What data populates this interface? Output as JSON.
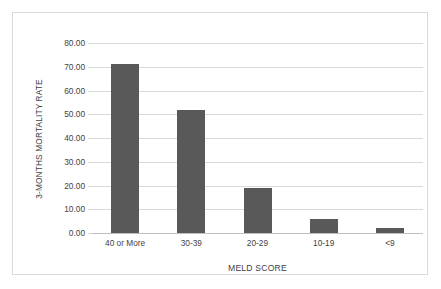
{
  "chart_data": {
    "type": "bar",
    "title": "",
    "xlabel": "MELD SCORE",
    "ylabel": "3-MONTHS MORTALITY RATE",
    "categories": [
      "40 or More",
      "30-39",
      "20-29",
      "10-19",
      "<9"
    ],
    "values": [
      71.0,
      52.0,
      19.0,
      6.0,
      2.0
    ],
    "ylim": [
      0,
      80
    ],
    "ytick_labels": [
      "80.00",
      "70.00",
      "60.00",
      "50.00",
      "40.00",
      "30.00",
      "20.00",
      "10.00",
      "0.00"
    ],
    "ytick_values": [
      80,
      70,
      60,
      50,
      40,
      30,
      20,
      10,
      0
    ],
    "grid": true,
    "legend": "none",
    "series": [
      {
        "name": "3-Months Mortality Rate",
        "values": [
          71.0,
          52.0,
          19.0,
          6.0,
          2.0
        ]
      }
    ],
    "colors": {
      "bar": "#595959",
      "gridline": "#d9d9d9",
      "baseline": "#bfbfbf",
      "text": "#3f3f3f",
      "frame": "#d9d9d9",
      "background": "#ffffff"
    }
  }
}
